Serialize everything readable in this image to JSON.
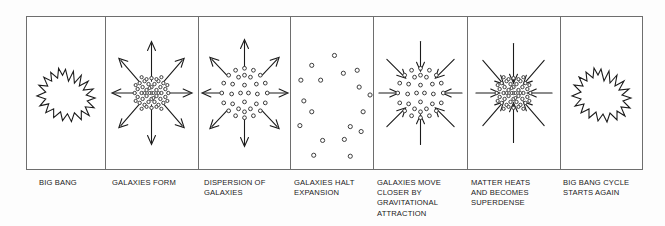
{
  "figure": {
    "panel_count": 7,
    "border_color": "#6e6e6e",
    "ink_color": "#1b1b1b",
    "background_color": "#ffffff"
  },
  "panels": [
    {
      "id": "big-bang",
      "caption": "BIG BANG",
      "motif": "starburst",
      "arrows": "none",
      "galaxy_count": 0
    },
    {
      "id": "galaxies-form",
      "caption": "GALAXIES FORM",
      "motif": "dense-cluster",
      "arrows": "outward-8",
      "galaxy_count": 52
    },
    {
      "id": "dispersion-of-galaxies",
      "caption": "DISPERSION OF\nGALAXIES",
      "motif": "ring-spread",
      "arrows": "outward-8",
      "galaxy_count": 34
    },
    {
      "id": "galaxies-halt-expansion",
      "caption": "GALAXIES HALT\nEXPANSION",
      "motif": "scattered",
      "arrows": "none",
      "galaxy_count": 18
    },
    {
      "id": "galaxies-move-closer",
      "caption": "GALAXIES MOVE\nCLOSER BY\nGRAVITATIONAL\nATTRACTION",
      "motif": "ring-spread",
      "arrows": "inward-8",
      "galaxy_count": 34
    },
    {
      "id": "matter-heats-superdense",
      "caption": "MATTER HEATS\nAND BECOMES\nSUPERDENSE",
      "motif": "dense-cluster",
      "arrows": "inward-8",
      "galaxy_count": 52
    },
    {
      "id": "big-bang-cycle-starts-again",
      "caption": "BIG BANG CYCLE\nSTARTS AGAIN",
      "motif": "starburst",
      "arrows": "none",
      "galaxy_count": 0
    }
  ]
}
